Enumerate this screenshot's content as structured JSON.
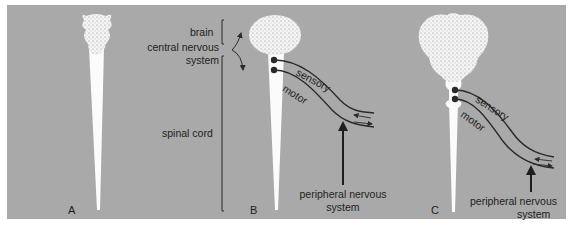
{
  "figure": {
    "background_color": "#a9a9a9",
    "panels": [
      {
        "id": "A",
        "label": "A"
      },
      {
        "id": "B",
        "label": "B"
      },
      {
        "id": "C",
        "label": "C"
      }
    ],
    "labels": {
      "brain": "brain",
      "cns_line1": "central nervous",
      "cns_line2": "system",
      "spinal_cord": "spinal cord",
      "sensory": "sensory",
      "motor": "motor",
      "pns_line1": "peripheral nervous",
      "pns_line2": "system"
    }
  }
}
